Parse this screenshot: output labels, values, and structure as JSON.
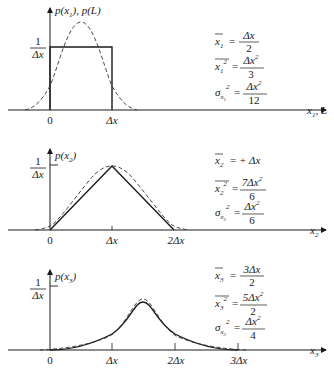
{
  "panels": [
    {
      "id": "panel-1",
      "ylabel": "p(x₁), p(L)",
      "xlabel": "x₁, L",
      "yTickLabel": {
        "num": "1",
        "den": "Δx"
      },
      "xTicks": [
        "0",
        "Δx"
      ],
      "solid_curve": "uniform (rectangle) from 0 to Δx, height 1/Δx",
      "dashed_curve": "Gaussian approximation",
      "equations": [
        {
          "lhs": "x̅₁",
          "rhs_num": "Δx",
          "rhs_den": "2"
        },
        {
          "lhs": "x₁² (mean)",
          "rhs_num": "Δx²",
          "rhs_den": "3"
        },
        {
          "lhs": "σx₁²",
          "rhs_num": "Δx²",
          "rhs_den": "12"
        }
      ]
    },
    {
      "id": "panel-2",
      "ylabel": "p(x₂)",
      "xlabel": "x₂",
      "yTickLabel": {
        "num": "1",
        "den": "Δx"
      },
      "xTicks": [
        "0",
        "Δx",
        "2Δx"
      ],
      "solid_curve": "triangle from 0 to 2Δx, peak 1/Δx at Δx",
      "dashed_curve": "Gaussian approximation",
      "equations": [
        {
          "lhs": "x̅₂",
          "rhs": "+Δx"
        },
        {
          "lhs": "x₂² (mean)",
          "rhs_num": "7Δx²",
          "rhs_den": "6"
        },
        {
          "lhs": "σx₂²",
          "rhs_num": "Δx²",
          "rhs_den": "6"
        }
      ]
    },
    {
      "id": "panel-3",
      "ylabel": "p(x₃)",
      "xlabel": "x₃",
      "yTickLabel": {
        "num": "1",
        "den": "Δx"
      },
      "xTicks": [
        "0",
        "Δx",
        "2Δx",
        "3Δx"
      ],
      "solid_curve": "piecewise quadratic from 0 to 3Δx, peak 3/(4Δx) at 3Δx/2",
      "dashed_curve": "Gaussian approximation",
      "equations": [
        {
          "lhs": "x̅₃",
          "rhs_num": "3Δx",
          "rhs_den": "2"
        },
        {
          "lhs": "x₃² (mean)",
          "rhs_num": "5Δx²",
          "rhs_den": "2"
        },
        {
          "lhs": "σx₃²",
          "rhs_num": "Δx²",
          "rhs_den": "4"
        }
      ]
    }
  ],
  "text": {
    "one": "1",
    "dx": "Δx",
    "zero": "0",
    "two_dx": "2Δx",
    "three_dx": "3Δx",
    "p1": "p(x",
    "p1b": "), p(L)",
    "p2": "p(x",
    "p3": "p(x",
    "close": ")",
    "sub1": "1",
    "sub2": "2",
    "sub3": "3",
    "x": "x",
    "xl1tail": ", L",
    "eq": "=",
    "sigma": "σ",
    "sq": "2",
    "plus_dx": "+ Δx",
    "dx2": "Δx",
    "n7dx": "7Δx",
    "n5dx": "5Δx",
    "n3dx": "3Δx",
    "d2": "2",
    "d3": "3",
    "d4": "4",
    "d6": "6",
    "d12": "12"
  }
}
